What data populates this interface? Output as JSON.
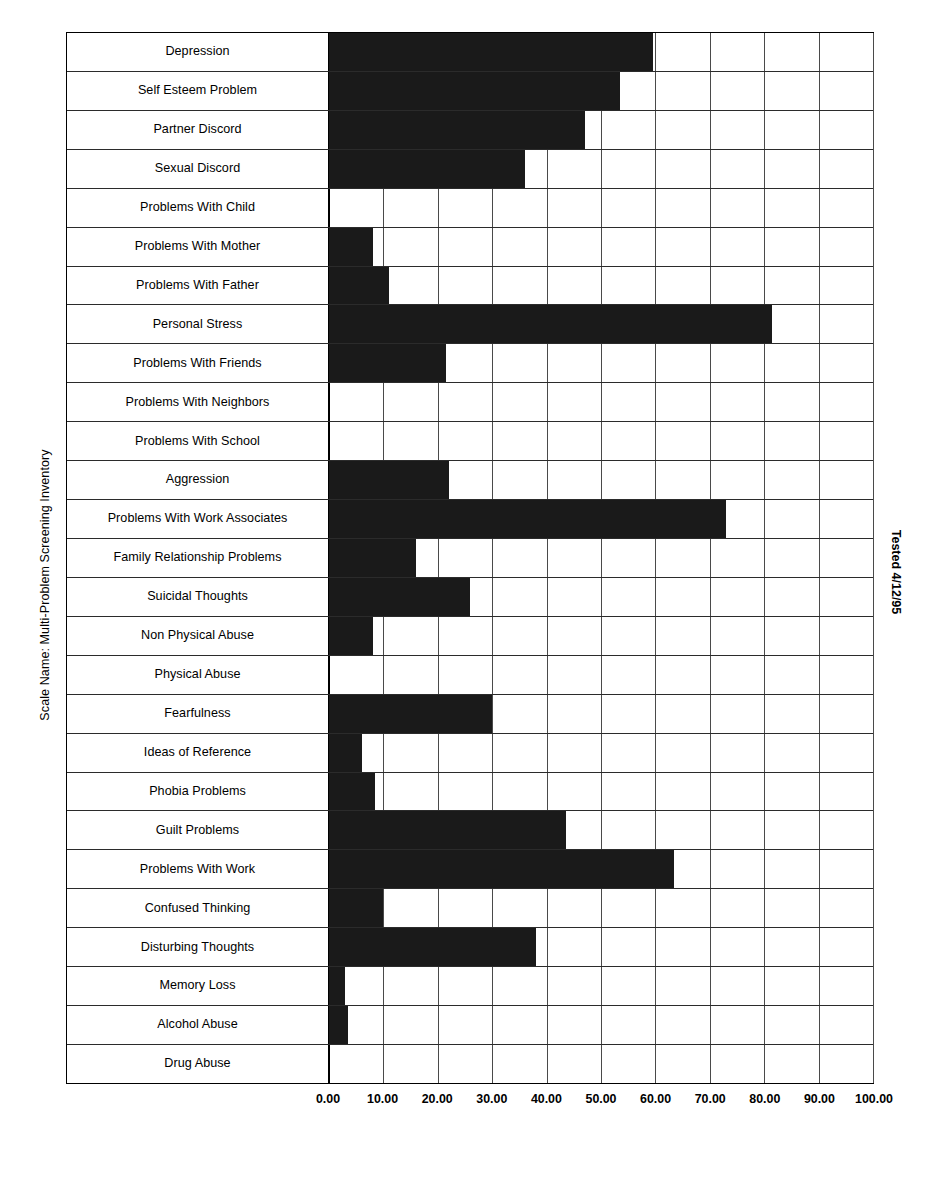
{
  "chart_data": {
    "type": "bar",
    "orientation": "horizontal",
    "title": "",
    "subtitle": "",
    "xlabel": "",
    "ylabel": "Scale Name: Multi-Problem Screening Inventory",
    "xlim": [
      0,
      100
    ],
    "xticks": [
      0,
      10,
      20,
      30,
      40,
      50,
      60,
      70,
      80,
      90,
      100
    ],
    "xtick_labels": [
      "0.00",
      "10.00",
      "20.00",
      "30.00",
      "40.00",
      "50.00",
      "60.00",
      "70.00",
      "80.00",
      "90.00",
      "100.00"
    ],
    "grid": true,
    "legend": null,
    "bar_color": "#1a1a1a",
    "annotations": [
      "Tested 4/12/95"
    ],
    "categories": [
      "Depression",
      "Self Esteem Problem",
      "Partner Discord",
      "Sexual Discord",
      "Problems With Child",
      "Problems With Mother",
      "Problems With Father",
      "Personal Stress",
      "Problems With Friends",
      "Problems With Neighbors",
      "Problems With School",
      "Aggression",
      "Problems With Work Associates",
      "Family Relationship Problems",
      "Suicidal Thoughts",
      "Non Physical Abuse",
      "Physical Abuse",
      "Fearfulness",
      "Ideas of Reference",
      "Phobia Problems",
      "Guilt Problems",
      "Problems With Work",
      "Confused Thinking",
      "Disturbing Thoughts",
      "Memory Loss",
      "Alcohol Abuse",
      "Drug Abuse"
    ],
    "values": [
      59.5,
      53.5,
      47.0,
      36.0,
      0.0,
      8.0,
      11.0,
      81.5,
      21.5,
      0.0,
      0.0,
      22.0,
      73.0,
      16.0,
      26.0,
      8.0,
      0.0,
      30.0,
      6.0,
      8.5,
      43.5,
      63.5,
      10.0,
      38.0,
      3.0,
      3.5,
      0.0
    ]
  },
  "axis": {
    "y_title": "Scale Name: Multi-Problem Screening Inventory",
    "right_note": "Tested 4/12/95"
  },
  "caption": {
    "text": ""
  }
}
